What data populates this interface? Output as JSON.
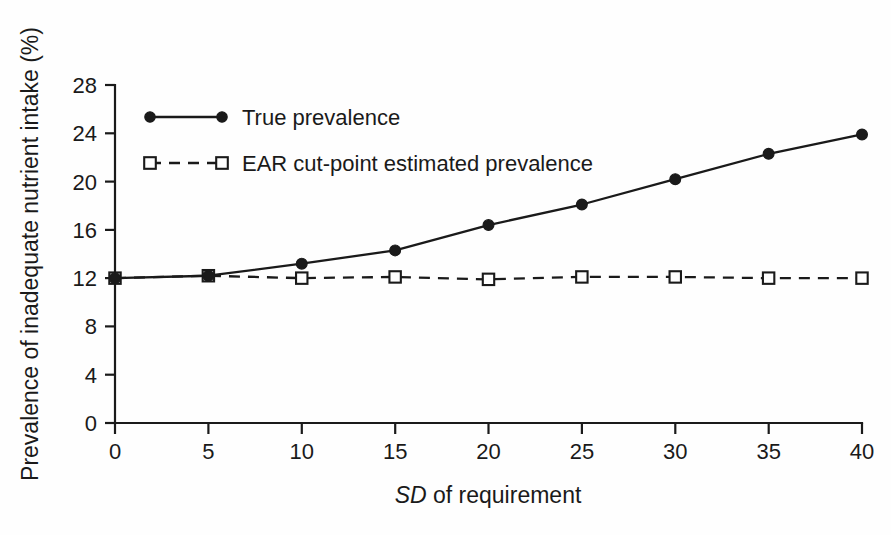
{
  "chart_data": {
    "type": "line",
    "title": "",
    "xlabel": "SD of requirement",
    "xlabel_emphasis": "SD",
    "xlabel_rest": " of requirement",
    "ylabel": "Prevalence of inadequate nutrient intake (%)",
    "x": [
      0,
      5,
      10,
      15,
      20,
      25,
      30,
      35,
      40
    ],
    "xticks": [
      "0",
      "5",
      "10",
      "15",
      "20",
      "25",
      "30",
      "35",
      "40"
    ],
    "yticks": [
      "0",
      "4",
      "8",
      "12",
      "16",
      "20",
      "24",
      "28"
    ],
    "xlim": [
      0,
      40
    ],
    "ylim": [
      0,
      28
    ],
    "grid": false,
    "legend_position": "upper-left-inside",
    "series": [
      {
        "name": "True prevalence",
        "marker": "filled-circle",
        "linestyle": "solid",
        "color": "#1a1a1a",
        "values": [
          12.0,
          12.2,
          13.2,
          14.3,
          16.4,
          18.1,
          20.2,
          22.3,
          23.9
        ]
      },
      {
        "name": "EAR cut-point estimated prevalence",
        "marker": "open-square",
        "linestyle": "dashed",
        "color": "#1a1a1a",
        "values": [
          12.0,
          12.2,
          12.0,
          12.1,
          11.9,
          12.1,
          12.1,
          12.0,
          12.0
        ]
      }
    ]
  },
  "legend": {
    "items": [
      {
        "label": "True prevalence"
      },
      {
        "label": "EAR cut-point estimated prevalence"
      }
    ]
  },
  "colors": {
    "ink": "#1a1a1a",
    "background": "#ffffff"
  }
}
